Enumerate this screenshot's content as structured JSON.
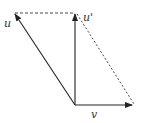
{
  "diagram": {
    "labels": {
      "u": "u",
      "u_prime": "u'",
      "v": "v"
    },
    "colors": {
      "stroke": "#222222",
      "background": "#ffffff"
    },
    "points": {
      "origin": [
        75,
        105
      ],
      "u_tip": [
        14,
        13
      ],
      "u_prime_tip": [
        75,
        13
      ],
      "v_tip": [
        133,
        105
      ]
    }
  }
}
